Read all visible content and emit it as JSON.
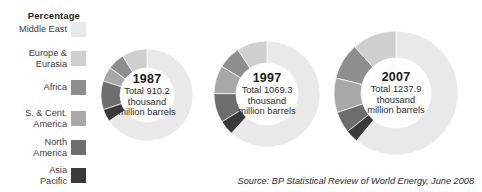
{
  "legend": {
    "title": "Percentage",
    "items": [
      {
        "label": "Middle East",
        "color": "#e9e9e9"
      },
      {
        "label": "Europe &\nEurasia",
        "color": "#cfcfcf"
      },
      {
        "label": "Africa",
        "color": "#8e8e8e"
      },
      {
        "label": "S. & Cent.\nAmerica",
        "color": "#a8a8a8"
      },
      {
        "label": "North\nAmerica",
        "color": "#6d6d6d"
      },
      {
        "label": "Asia\nPacific",
        "color": "#3a3a3a"
      }
    ]
  },
  "source": "Source: BP Statistical Review of World Energy, June 2008",
  "chart_data": {
    "type": "pie",
    "title": "",
    "subtitle": "",
    "xlabel": "",
    "ylabel": "",
    "legend_position": "left",
    "units": "thousand million barrels",
    "regions": [
      "Middle East",
      "Europe & Eurasia",
      "Africa",
      "S. & Cent. America",
      "North America",
      "Asia Pacific"
    ],
    "colors": [
      "#e9e9e9",
      "#cfcfcf",
      "#8e8e8e",
      "#a8a8a8",
      "#6d6d6d",
      "#3a3a3a"
    ],
    "charts": [
      {
        "year": "1987",
        "total_label": "Total 910.2",
        "total_line2": "thousand",
        "total_line3": "million barrels",
        "total_value": 910.2,
        "values": [
          65.4,
          8.9,
          6.0,
          5.2,
          10.1,
          4.4
        ],
        "radius": 46,
        "inner_radius": 27,
        "cx": 147,
        "cy": 95
      },
      {
        "year": "1997",
        "total_label": "Total 1069.3",
        "total_line2": "thousand",
        "total_line3": "million barrels",
        "total_value": 1069.3,
        "values": [
          61.7,
          9.3,
          7.0,
          8.6,
          8.9,
          4.5
        ],
        "radius": 53,
        "inner_radius": 31,
        "cx": 267,
        "cy": 94
      },
      {
        "year": "2007",
        "total_label": "Total 1237.9",
        "total_line2": "thousand",
        "total_line3": "million barrels",
        "total_value": 1237.9,
        "values": [
          61.0,
          11.6,
          9.5,
          9.0,
          5.6,
          3.3
        ],
        "radius": 62,
        "inner_radius": 35,
        "cx": 396,
        "cy": 93
      }
    ]
  }
}
